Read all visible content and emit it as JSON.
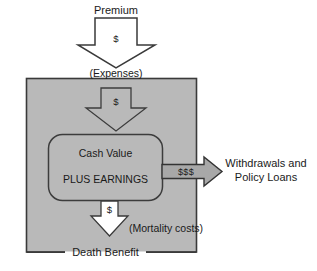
{
  "diagram": {
    "title_text": "Premium",
    "colors": {
      "background": "#ffffff",
      "box_fill": "#b9b9b9",
      "box_stroke": "#3a3a3a",
      "inner_fill": "#b9b9b9",
      "inner_stroke": "#3c3c3c",
      "arrow_white_fill": "#ffffff",
      "arrow_white_stroke": "#3a3a3a",
      "arrow_gray_fill": "#a8a8a8",
      "arrow_gray_stroke": "#333333",
      "text": "#1a1a1a"
    },
    "labels": {
      "premium": "Premium",
      "expenses": "(Expenses)",
      "dollar_top": "$",
      "dollar_inner": "$",
      "dollar_bottom": "$",
      "dollars_out": "$$$",
      "cash_value": "Cash Value",
      "plus_earnings": "PLUS EARNINGS",
      "mortality_costs": "(Mortality costs)",
      "withdrawals_line1": "Withdrawals and",
      "withdrawals_line2": "Policy Loans",
      "death_benefit": "Death Benefit"
    },
    "icons": {
      "premium_arrow": "arrow-down-icon",
      "expenses_arrow": "arrow-down-icon",
      "mortality_arrow": "arrow-down-icon",
      "withdrawals_arrow": "arrow-right-icon"
    }
  }
}
